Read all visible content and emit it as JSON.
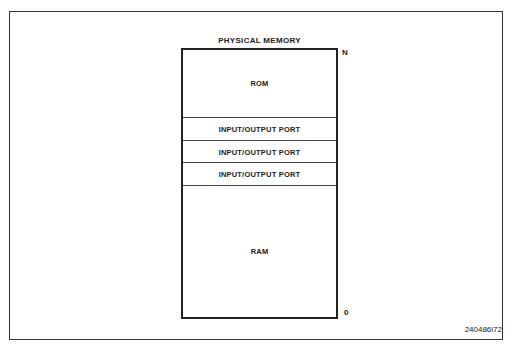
{
  "diagram": {
    "title": "PHYSICAL MEMORY",
    "top_label": "N",
    "bottom_label": "0",
    "segments": [
      {
        "label": "ROM"
      },
      {
        "label": "INPUT/OUTPUT PORT"
      },
      {
        "label": "INPUT/OUTPUT PORT"
      },
      {
        "label": "INPUT/OUTPUT PORT"
      },
      {
        "label": "RAM"
      }
    ],
    "figure_id": "240486i72"
  }
}
